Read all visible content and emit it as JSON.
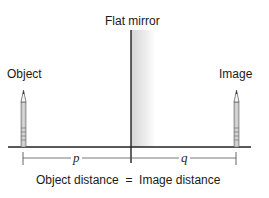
{
  "diagram": {
    "mirror_label": "Flat mirror",
    "object_label": "Object",
    "image_label": "Image",
    "object_distance_symbol": "p",
    "image_distance_symbol": "q",
    "caption": "Object distance  =  Image distance"
  },
  "colors": {
    "line": "#222222",
    "pencil_fill": "#c9c9c9",
    "pencil_edge": "#555555",
    "mirror_shade_start": "#dcdcdc",
    "mirror_shade_end": "#ffffff",
    "dimension_line": "#555555"
  }
}
